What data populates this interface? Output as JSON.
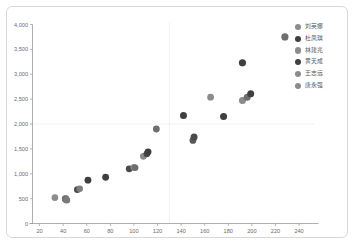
{
  "chart_data": {
    "type": "scatter",
    "title": "",
    "xlabel": "",
    "ylabel": "",
    "xlim": [
      14,
      248
    ],
    "ylim": [
      0,
      4000
    ],
    "grid": true,
    "legend_position": "right",
    "x_ticks": [
      "20",
      "40",
      "60",
      "80",
      "100",
      "120",
      "140",
      "160",
      "180",
      "200",
      "220",
      "240"
    ],
    "x_tick_values": [
      20,
      40,
      60,
      80,
      100,
      120,
      140,
      160,
      180,
      200,
      220,
      240
    ],
    "y_ticks": [
      "0",
      "500",
      "1,000",
      "1,500",
      "2,000",
      "2,500",
      "3,000",
      "3,500",
      "4,000"
    ],
    "y_tick_values": [
      0,
      500,
      1000,
      1500,
      2000,
      2500,
      3000,
      3500,
      4000
    ],
    "gridlines_x": [
      130
    ],
    "gridlines_y": [
      2000
    ],
    "colors": {
      "light_gray": "#8c8c8c",
      "dark_gray": "#3f3f3f",
      "axis": "#9a9a9a",
      "grid": "#ececec",
      "text": "#6b6b6b",
      "border": "#d8d8d8"
    },
    "series": [
      {
        "name": "刘英娜",
        "color": "#8c8c8c",
        "points": [
          [
            33,
            520
          ],
          [
            42,
            500
          ],
          [
            43,
            470
          ],
          [
            54,
            700
          ],
          [
            100,
            1130
          ],
          [
            108,
            1350
          ],
          [
            151,
            1660
          ],
          [
            165,
            2540
          ],
          [
            192,
            2470
          ],
          [
            194,
            2520
          ]
        ]
      },
      {
        "name": "杜凤琪",
        "color": "#3f3f3f",
        "points": [
          [
            42,
            490
          ],
          [
            52,
            680
          ],
          [
            61,
            870
          ],
          [
            76,
            930
          ],
          [
            96,
            1100
          ],
          [
            98,
            1110
          ],
          [
            111,
            1400
          ],
          [
            112,
            1440
          ],
          [
            119,
            1900
          ],
          [
            142,
            2170
          ],
          [
            150,
            1720
          ],
          [
            151,
            1760
          ],
          [
            176,
            2150
          ],
          [
            192,
            3230
          ],
          [
            197,
            2570
          ],
          [
            199,
            2610
          ],
          [
            228,
            3750
          ]
        ]
      },
      {
        "name": "林建兆",
        "color": "#8c8c8c",
        "points": []
      },
      {
        "name": "黄天成",
        "color": "#3f3f3f",
        "points": []
      },
      {
        "name": "王志远",
        "color": "#8c8c8c",
        "points": []
      },
      {
        "name": "唐永强",
        "color": "#8c8c8c",
        "points": []
      }
    ],
    "all_points": [
      {
        "x": 33,
        "y": 520,
        "color": "#8c8c8c",
        "r": 3.3
      },
      {
        "x": 42,
        "y": 500,
        "color": "#8c8c8c",
        "r": 3.6
      },
      {
        "x": 42,
        "y": 490,
        "color": "#6e6e6e",
        "r": 3.6
      },
      {
        "x": 43,
        "y": 470,
        "color": "#7a7a7a",
        "r": 3.5
      },
      {
        "x": 52,
        "y": 680,
        "color": "#4a4a4a",
        "r": 3.3
      },
      {
        "x": 54,
        "y": 700,
        "color": "#7d7d7d",
        "r": 3.3
      },
      {
        "x": 61,
        "y": 870,
        "color": "#3f3f3f",
        "r": 3.4
      },
      {
        "x": 76,
        "y": 930,
        "color": "#3f3f3f",
        "r": 3.4
      },
      {
        "x": 96,
        "y": 1100,
        "color": "#4a4a4a",
        "r": 3.4
      },
      {
        "x": 100,
        "y": 1130,
        "color": "#8c8c8c",
        "r": 3.4
      },
      {
        "x": 101,
        "y": 1120,
        "color": "#6e6e6e",
        "r": 3.3
      },
      {
        "x": 108,
        "y": 1350,
        "color": "#8c8c8c",
        "r": 3.4
      },
      {
        "x": 111,
        "y": 1400,
        "color": "#4a4a4a",
        "r": 3.4
      },
      {
        "x": 112,
        "y": 1440,
        "color": "#3f3f3f",
        "r": 3.4
      },
      {
        "x": 119,
        "y": 1900,
        "color": "#6e6e6e",
        "r": 3.4
      },
      {
        "x": 142,
        "y": 2170,
        "color": "#3f3f3f",
        "r": 3.5
      },
      {
        "x": 150,
        "y": 1670,
        "color": "#5a5a5a",
        "r": 3.4
      },
      {
        "x": 151,
        "y": 1740,
        "color": "#4a4a4a",
        "r": 3.5
      },
      {
        "x": 165,
        "y": 2540,
        "color": "#8c8c8c",
        "r": 3.4
      },
      {
        "x": 176,
        "y": 2150,
        "color": "#3f3f3f",
        "r": 3.5
      },
      {
        "x": 192,
        "y": 3230,
        "color": "#3f3f3f",
        "r": 3.6
      },
      {
        "x": 192,
        "y": 2470,
        "color": "#8c8c8c",
        "r": 3.5
      },
      {
        "x": 196,
        "y": 2540,
        "color": "#6e6e6e",
        "r": 3.5
      },
      {
        "x": 199,
        "y": 2610,
        "color": "#3f3f3f",
        "r": 3.5
      },
      {
        "x": 228,
        "y": 3750,
        "color": "#6e6e6e",
        "r": 3.6
      }
    ]
  },
  "legend": {
    "items": [
      {
        "label": "刘英娜",
        "color": "#8c8c8c"
      },
      {
        "label": "杜凤琪",
        "color": "#3f3f3f"
      },
      {
        "label": "林建兆",
        "color": "#8c8c8c"
      },
      {
        "label": "黄天成",
        "color": "#3f3f3f"
      },
      {
        "label": "王志远",
        "color": "#8c8c8c"
      },
      {
        "label": "唐永强",
        "color": "#8c8c8c"
      }
    ]
  }
}
